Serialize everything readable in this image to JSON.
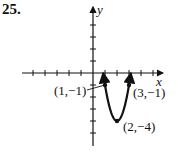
{
  "problem_number": "25.",
  "chart_data": {
    "type": "line",
    "title": "",
    "xlabel": "x",
    "ylabel": "y",
    "function": "y = 3(x-2)^2 - 4",
    "x_ticks": [
      -5,
      -4,
      -3,
      -2,
      -1,
      1,
      2,
      3,
      4,
      5
    ],
    "y_ticks": [
      4,
      3,
      2,
      1,
      -1,
      -2,
      -3,
      -4,
      -5
    ],
    "xlim": [
      -5.5,
      5.5
    ],
    "ylim": [
      -5.5,
      4.5
    ],
    "grid": false,
    "points": [
      {
        "x": 1,
        "y": -1,
        "label": "(1,−1)"
      },
      {
        "x": 3,
        "y": -1,
        "label": "(3,−1)"
      },
      {
        "x": 2,
        "y": -4,
        "label": "(2,−4)"
      }
    ],
    "annotations": [
      "(1,−1)",
      "(3,−1)",
      "(2,−4)"
    ]
  }
}
